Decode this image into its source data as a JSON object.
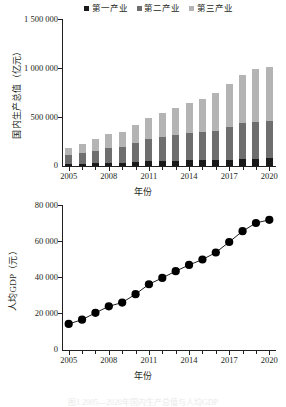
{
  "figure": {
    "caption": "图1  2005—2020年国内生产总值与人均GDP"
  },
  "top": {
    "legend": [
      {
        "label": "第一产业",
        "color": "#1a1a1a"
      },
      {
        "label": "第二产业",
        "color": "#6e6e6e"
      },
      {
        "label": "第三产业",
        "color": "#b4b4b4"
      }
    ],
    "ylabel": "国内生产总值（亿元）",
    "xlabel": "年份",
    "yticks": [
      "0",
      "500 000",
      "1 000 000",
      "1 500 000"
    ],
    "xticks": [
      "2005",
      "2008",
      "2011",
      "2014",
      "2017",
      "2020"
    ]
  },
  "bottom": {
    "ylabel": "人均GDP（元）",
    "xlabel": "年份",
    "yticks": [
      "0",
      "20 000",
      "40 000",
      "60 000",
      "80 000"
    ],
    "xticks": [
      "2005",
      "2008",
      "2011",
      "2014",
      "2017",
      "2020"
    ]
  },
  "chart_data": [
    {
      "type": "bar",
      "stacked": true,
      "title": "",
      "xlabel": "年份",
      "ylabel": "国内生产总值（亿元）",
      "ylim": [
        0,
        1500000
      ],
      "ytick_values": [
        0,
        500000,
        1000000,
        1500000
      ],
      "grid": false,
      "legend_position": "top",
      "categories": [
        "2005",
        "2006",
        "2007",
        "2008",
        "2009",
        "2010",
        "2011",
        "2012",
        "2013",
        "2014",
        "2015",
        "2016",
        "2017",
        "2018",
        "2019",
        "2020"
      ],
      "series": [
        {
          "name": "第一产业",
          "color": "#1a1a1a",
          "values": [
            22420,
            24040,
            28627,
            33702,
            35226,
            40534,
            46163,
            50902,
            55329,
            58332,
            60863,
            63673,
            65468,
            70017,
            70474,
            78031
          ]
        },
        {
          "name": "第二产业",
          "color": "#6e6e6e",
          "values": [
            88084,
            104362,
            126633,
            152796,
            160171,
            191630,
            227039,
            244643,
            261956,
            277572,
            281338,
            296236,
            331581,
            364835,
            380671,
            383562
          ]
        },
        {
          "name": "第三产业",
          "color": "#b4b4b4",
          "values": [
            77428,
            91759,
            115810,
            137026,
            155477,
            182038,
            216099,
            244822,
            277983,
            308082,
            346178,
            383374,
            438356,
            489701,
            535371,
            553977
          ]
        }
      ],
      "totals": [
        187932,
        220161,
        271070,
        323524,
        350874,
        414202,
        489301,
        540367,
        595268,
        643986,
        688379,
        743283,
        835405,
        924553,
        986516,
        1015570
      ]
    },
    {
      "type": "line",
      "title": "",
      "xlabel": "年份",
      "ylabel": "人均GDP（元）",
      "ylim": [
        0,
        80000
      ],
      "ytick_values": [
        0,
        20000,
        40000,
        60000,
        80000
      ],
      "grid": false,
      "marker": "circle",
      "x": [
        "2005",
        "2006",
        "2007",
        "2008",
        "2009",
        "2010",
        "2011",
        "2012",
        "2013",
        "2014",
        "2015",
        "2016",
        "2017",
        "2018",
        "2019",
        "2020"
      ],
      "values": [
        14368,
        16738,
        20494,
        24100,
        26180,
        30808,
        36277,
        39771,
        43497,
        46912,
        49922,
        53783,
        59592,
        65534,
        70078,
        71828
      ]
    }
  ]
}
